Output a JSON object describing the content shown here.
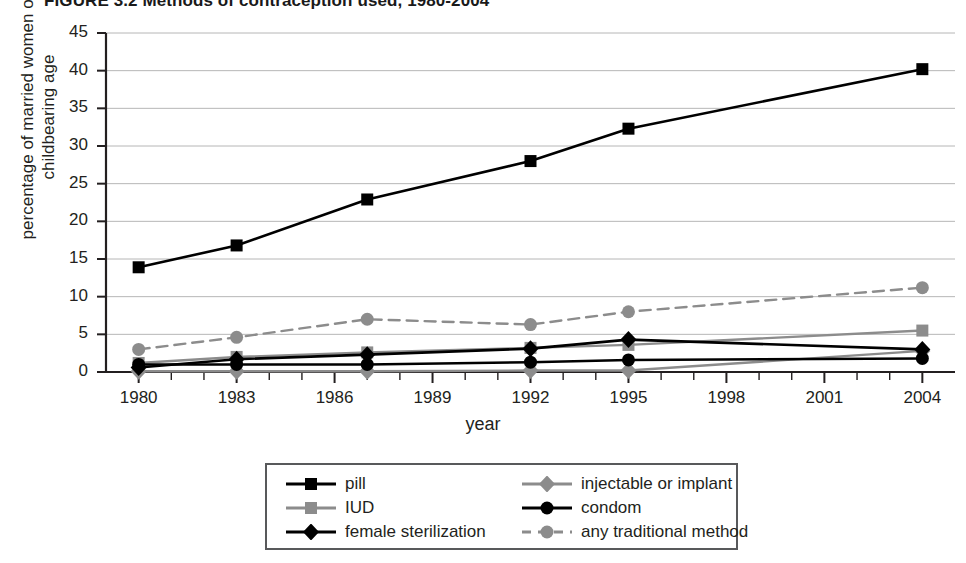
{
  "figure": {
    "title": "FIGURE 3.2 Methods of contraception used, 1980-2004"
  },
  "chart_data": {
    "type": "line",
    "title": "FIGURE 3.2 Methods of contraception used, 1980-2004",
    "xlabel": "year",
    "ylabel": "percentage of married women of childbearing age",
    "xlim": [
      1979,
      2005
    ],
    "ylim": [
      0,
      45
    ],
    "ytick_labels": [
      "0",
      "5",
      "10",
      "15",
      "20",
      "25",
      "30",
      "35",
      "40",
      "45"
    ],
    "ytick_values": [
      0,
      5,
      10,
      15,
      20,
      25,
      30,
      35,
      40,
      45
    ],
    "xtick_labels": [
      "1980",
      "1983",
      "1986",
      "1989",
      "1992",
      "1995",
      "1998",
      "2001",
      "2004"
    ],
    "xtick_values": [
      1980,
      1983,
      1986,
      1989,
      1992,
      1995,
      1998,
      2001,
      2004
    ],
    "minor_xticks": true,
    "grid": "horizontal",
    "legend_position": "below-center",
    "series": [
      {
        "name": "pill",
        "color": "#000000",
        "marker": "square",
        "dash": false,
        "x": [
          1980,
          1983,
          1987,
          1992,
          1995,
          2004
        ],
        "values": [
          13.9,
          16.8,
          22.9,
          28.0,
          32.3,
          40.2
        ]
      },
      {
        "name": "IUD",
        "color": "#8c8c8c",
        "marker": "square",
        "dash": false,
        "x": [
          1980,
          1983,
          1987,
          1992,
          1995,
          2004
        ],
        "values": [
          1.2,
          2.0,
          2.6,
          3.2,
          3.6,
          5.5
        ]
      },
      {
        "name": "female sterilization",
        "color": "#000000",
        "marker": "diamond",
        "dash": false,
        "x": [
          1980,
          1983,
          1987,
          1992,
          1995,
          2004
        ],
        "values": [
          0.6,
          1.7,
          2.3,
          3.1,
          4.3,
          3.0
        ]
      },
      {
        "name": "injectable or implant",
        "color": "#8c8c8c",
        "marker": "diamond",
        "dash": false,
        "x": [
          1980,
          1983,
          1987,
          1992,
          1995,
          2004
        ],
        "values": [
          0.1,
          0.1,
          0.1,
          0.2,
          0.2,
          2.8
        ]
      },
      {
        "name": "condom",
        "color": "#000000",
        "marker": "circle",
        "dash": false,
        "x": [
          1980,
          1983,
          1987,
          1992,
          1995,
          2004
        ],
        "values": [
          1.0,
          1.0,
          1.0,
          1.3,
          1.6,
          1.8
        ]
      },
      {
        "name": "any traditional method",
        "color": "#8c8c8c",
        "marker": "circle",
        "dash": true,
        "x": [
          1980,
          1983,
          1987,
          1992,
          1995,
          2004
        ],
        "values": [
          3.0,
          4.6,
          7.0,
          6.3,
          8.0,
          11.2
        ]
      }
    ]
  },
  "legend": {
    "items": [
      {
        "label": "pill",
        "series": 0
      },
      {
        "label": "injectable or implant",
        "series": 3
      },
      {
        "label": "IUD",
        "series": 1
      },
      {
        "label": "condom",
        "series": 4
      },
      {
        "label": "female sterilization",
        "series": 2
      },
      {
        "label": "any traditional method",
        "series": 5
      }
    ]
  },
  "colors": {
    "black": "#000000",
    "gray": "#8c8c8c",
    "grid": "#b6b6b6",
    "axis": "#231f20",
    "legend_border": "#58595b"
  }
}
